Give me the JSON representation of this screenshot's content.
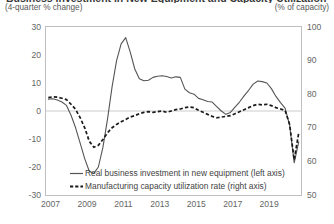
{
  "figure": {
    "title": "Business Investment in New Equipment and Capacity Utilization",
    "unit_left": "(4-quarter % change)",
    "unit_right": "(% of capacity)"
  },
  "chart_data": {
    "type": "line",
    "title": "Business Investment in New Equipment and Capacity Utilization",
    "xlabel": "",
    "ylabel": "(4-quarter % change)",
    "y2label": "(% of capacity)",
    "ylim": [
      -30,
      30
    ],
    "y2lim": [
      50,
      100
    ],
    "xlim": [
      2006.75,
      2020.75
    ],
    "grid": false,
    "zero_line": true,
    "legend_position": "bottom-center",
    "yticks": [
      30,
      20,
      10,
      0,
      -10,
      -20,
      -30
    ],
    "y2ticks": [
      100,
      90,
      80,
      70,
      60,
      50
    ],
    "xticks": [
      2007,
      2009,
      2011,
      2013,
      2015,
      2017,
      2019
    ],
    "xtick_labels": [
      "2007",
      "2009",
      "2011",
      "2013",
      "2015",
      "2017",
      "2019"
    ],
    "series": [
      {
        "name": "Real business investment in new equipment (left axis)",
        "axis": "left",
        "style": "solid",
        "color": "#555555",
        "x": [
          2006.875,
          2007.125,
          2007.375,
          2007.625,
          2007.875,
          2008.125,
          2008.375,
          2008.625,
          2008.875,
          2009.125,
          2009.375,
          2009.625,
          2009.875,
          2010.125,
          2010.375,
          2010.625,
          2010.875,
          2011.125,
          2011.375,
          2011.625,
          2011.875,
          2012.125,
          2012.375,
          2012.625,
          2012.875,
          2013.125,
          2013.375,
          2013.625,
          2013.875,
          2014.125,
          2014.375,
          2014.625,
          2014.875,
          2015.125,
          2015.375,
          2015.625,
          2015.875,
          2016.125,
          2016.375,
          2016.625,
          2016.875,
          2017.125,
          2017.375,
          2017.625,
          2017.875,
          2018.125,
          2018.375,
          2018.625,
          2018.875,
          2019.125,
          2019.375,
          2019.625,
          2019.875,
          2020.125,
          2020.375,
          2020.625
        ],
        "values": [
          4.2,
          4.4,
          3.9,
          3.2,
          2.0,
          -1.5,
          -6.0,
          -11.5,
          -17.0,
          -21.5,
          -22.3,
          -20.0,
          -13.0,
          -3.0,
          8.5,
          18.0,
          24.0,
          26.2,
          21.0,
          15.0,
          11.5,
          10.8,
          11.0,
          12.0,
          12.4,
          12.6,
          12.3,
          11.8,
          12.2,
          12.0,
          7.8,
          6.5,
          6.0,
          4.5,
          4.0,
          3.4,
          3.2,
          1.6,
          0.0,
          -1.2,
          -0.5,
          1.4,
          3.2,
          5.4,
          7.4,
          9.6,
          10.7,
          10.5,
          10.0,
          8.0,
          5.2,
          3.0,
          1.0,
          -5.0,
          -18.5,
          -11.0
        ]
      },
      {
        "name": "Manufacturing capacity utilization rate (right axis)",
        "axis": "right",
        "style": "dashed",
        "color": "#1a1a1a",
        "x": [
          2006.875,
          2007.125,
          2007.375,
          2007.625,
          2007.875,
          2008.125,
          2008.375,
          2008.625,
          2008.875,
          2009.125,
          2009.375,
          2009.625,
          2009.875,
          2010.125,
          2010.375,
          2010.625,
          2010.875,
          2011.125,
          2011.375,
          2011.625,
          2011.875,
          2012.125,
          2012.375,
          2012.625,
          2012.875,
          2013.125,
          2013.375,
          2013.625,
          2013.875,
          2014.125,
          2014.375,
          2014.625,
          2014.875,
          2015.125,
          2015.375,
          2015.625,
          2015.875,
          2016.125,
          2016.375,
          2016.625,
          2016.875,
          2017.125,
          2017.375,
          2017.625,
          2017.875,
          2018.125,
          2018.375,
          2018.625,
          2018.875,
          2019.125,
          2019.375,
          2019.625,
          2019.875,
          2020.125,
          2020.375,
          2020.625
        ],
        "values": [
          79.0,
          79.2,
          79.1,
          78.8,
          78.4,
          77.0,
          75.5,
          73.0,
          70.0,
          66.0,
          64.2,
          64.8,
          66.5,
          68.5,
          70.0,
          71.0,
          71.8,
          72.5,
          73.2,
          73.6,
          74.2,
          74.6,
          74.8,
          74.6,
          74.8,
          75.0,
          74.6,
          75.0,
          75.4,
          75.6,
          76.0,
          76.2,
          76.0,
          75.2,
          74.6,
          74.0,
          73.4,
          73.0,
          73.2,
          73.4,
          73.6,
          74.2,
          74.8,
          75.4,
          76.0,
          76.6,
          77.0,
          76.8,
          77.0,
          76.6,
          76.0,
          75.6,
          75.2,
          71.0,
          60.5,
          68.5
        ]
      }
    ]
  },
  "axes": {
    "y_left_ticks": [
      "30",
      "20",
      "10",
      "0",
      "-10",
      "-20",
      "-30"
    ],
    "y_right_ticks": [
      "100",
      "90",
      "80",
      "70",
      "60",
      "50"
    ],
    "x_ticks": [
      "2007",
      "2009",
      "2011",
      "2013",
      "2015",
      "2017",
      "2019"
    ]
  },
  "legend": {
    "items": [
      {
        "label": "Real business investment in new equipment (left axis)",
        "style": "solid"
      },
      {
        "label": "Manufacturing capacity utilization rate (right axis)",
        "style": "dashed"
      }
    ]
  }
}
